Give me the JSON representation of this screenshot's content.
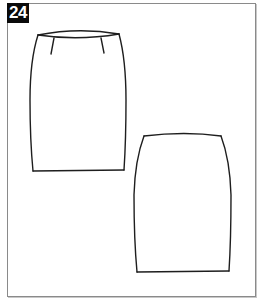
{
  "figure": {
    "number_label": "24",
    "badge_bg": "#0a0a0a",
    "badge_fg": "#ffffff",
    "frame_border": "#8a8a8a"
  },
  "drawings": [
    {
      "name": "skirt-front-view",
      "features": [
        "curved waistband",
        "two front darts",
        "straight pencil silhouette",
        "straight hem"
      ]
    },
    {
      "name": "skirt-back-view",
      "features": [
        "curved waistline",
        "tapered pencil silhouette",
        "straight hem"
      ]
    }
  ]
}
